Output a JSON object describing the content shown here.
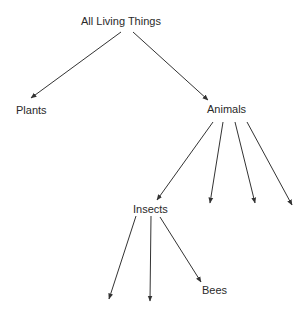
{
  "diagram": {
    "type": "tree",
    "nodes": [
      {
        "id": "root",
        "label": "All Living Things",
        "x": 127,
        "y": 22
      },
      {
        "id": "plants",
        "label": "Plants",
        "x": 30,
        "y": 110
      },
      {
        "id": "animals",
        "label": "Animals",
        "x": 245,
        "y": 110
      },
      {
        "id": "insects",
        "label": "Insects",
        "x": 150,
        "y": 209
      },
      {
        "id": "bees",
        "label": "Bees",
        "x": 213,
        "y": 290
      }
    ],
    "edges": [
      {
        "from": "root",
        "to": "plants",
        "x1": 121,
        "y1": 32,
        "x2": 31,
        "y2": 98
      },
      {
        "from": "root",
        "to": "animals",
        "x1": 133,
        "y1": 32,
        "x2": 208,
        "y2": 100
      },
      {
        "from": "animals",
        "to": "insects",
        "x1": 213,
        "y1": 122,
        "x2": 157,
        "y2": 200
      },
      {
        "from": "animals",
        "to": "",
        "x1": 223,
        "y1": 122,
        "x2": 210,
        "y2": 203
      },
      {
        "from": "animals",
        "to": "",
        "x1": 235,
        "y1": 122,
        "x2": 255,
        "y2": 203
      },
      {
        "from": "animals",
        "to": "",
        "x1": 247,
        "y1": 122,
        "x2": 292,
        "y2": 205
      },
      {
        "from": "insects",
        "to": "",
        "x1": 136,
        "y1": 216,
        "x2": 109,
        "y2": 299
      },
      {
        "from": "insects",
        "to": "",
        "x1": 151,
        "y1": 216,
        "x2": 150,
        "y2": 301
      },
      {
        "from": "insects",
        "to": "bees",
        "x1": 160,
        "y1": 217,
        "x2": 201,
        "y2": 282
      }
    ],
    "line_color": "#333333",
    "text_color": "#2a2a2a"
  }
}
